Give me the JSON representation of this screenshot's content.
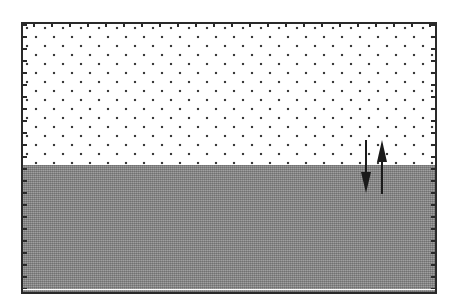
{
  "diagram": {
    "regions": [
      {
        "name": "upper-layer",
        "pattern": "dotted",
        "color": "#ffffff",
        "dot_color": "#3a3a3a"
      },
      {
        "name": "lower-layer",
        "pattern": "dense-crosshatch",
        "color": "#8a8a8a"
      }
    ],
    "arrows": [
      {
        "name": "downward-flux",
        "direction": "down",
        "x": 366,
        "y_start": 140,
        "y_end": 193
      },
      {
        "name": "upward-flux",
        "direction": "up",
        "x": 382,
        "y_start": 194,
        "y_end": 140
      }
    ],
    "colors": {
      "border": "#2a2a2a",
      "arrow": "#1a1a1a"
    }
  }
}
